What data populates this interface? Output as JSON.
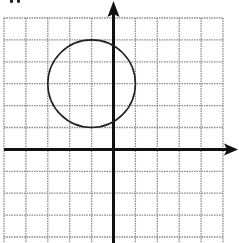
{
  "diagram": {
    "type": "coordinate-grid",
    "top_label_fragment": "\"",
    "grid": {
      "x_min": -5,
      "x_max": 5,
      "y_min": -4,
      "y_max": 6,
      "cell_px": 22,
      "line_color": "#8a8a8a",
      "line_style": "dotted"
    },
    "axes": {
      "color": "#111111",
      "x_axis_arrow": "right",
      "y_axis_arrow": "up"
    },
    "circle": {
      "center": [
        -1,
        3
      ],
      "radius": 2,
      "stroke": "#222222"
    }
  }
}
